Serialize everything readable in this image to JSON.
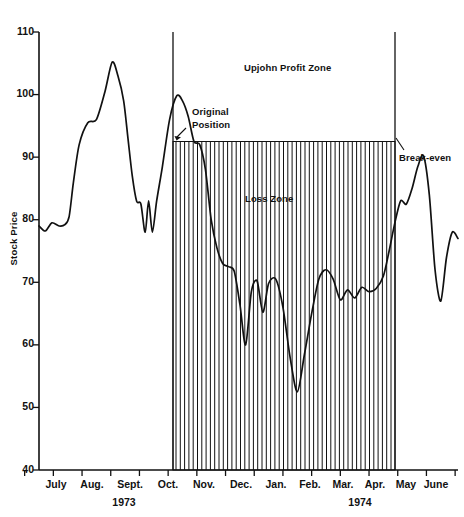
{
  "chart_data": {
    "type": "line",
    "title": "",
    "xlabel": "",
    "ylabel": "Stock Price",
    "ylim": [
      40,
      110
    ],
    "yticks": [
      40,
      50,
      60,
      70,
      80,
      90,
      100,
      110
    ],
    "ytick_labels": [
      "40",
      "50",
      "60",
      "70",
      "80",
      "90",
      "100",
      "110"
    ],
    "grid": false,
    "legend": "none",
    "xtick_labels": [
      "July",
      "Aug.",
      "Sept.",
      "Oct.",
      "Nov.",
      "Dec.",
      "Jan.",
      "Feb.",
      "Mar.",
      "Apr.",
      "May",
      "June",
      "July",
      "Aug.",
      "Sept."
    ],
    "year_labels": [
      "1973",
      "1974"
    ],
    "series": [
      {
        "name": "Upjohn stock price",
        "x": [
          0.0,
          0.22,
          0.45,
          0.7,
          0.9,
          1.05,
          1.2,
          1.4,
          1.7,
          2.0,
          2.3,
          2.55,
          2.75,
          2.95,
          3.1,
          3.25,
          3.4,
          3.55,
          3.7,
          3.82,
          3.95,
          4.1,
          4.3,
          4.55,
          4.8,
          5.0,
          5.2,
          5.4,
          5.6,
          5.8,
          6.0,
          6.2,
          6.4,
          6.6,
          6.8,
          7.0,
          7.2,
          7.4,
          7.6,
          7.8,
          8.0,
          8.25,
          8.5,
          8.75,
          9.0,
          9.25,
          9.5,
          9.75,
          10.0,
          10.25,
          10.5,
          10.75,
          11.0,
          11.25,
          11.5,
          11.75,
          12.0,
          12.2,
          12.4,
          12.6,
          12.8,
          13.0,
          13.2,
          13.4,
          13.6,
          13.8,
          14.0,
          14.2,
          14.4,
          14.6
        ],
        "values": [
          79.0,
          78.2,
          79.5,
          79.0,
          79.2,
          80.5,
          86.0,
          92.0,
          95.5,
          96.0,
          100.5,
          105.2,
          103.0,
          99.0,
          93.0,
          87.0,
          83.0,
          82.5,
          78.0,
          83.0,
          78.0,
          83.0,
          88.5,
          96.0,
          99.8,
          99.0,
          96.5,
          92.5,
          92.0,
          88.0,
          80.0,
          75.5,
          73.0,
          72.5,
          71.8,
          66.5,
          60.0,
          68.5,
          70.2,
          65.2,
          69.8,
          70.5,
          66.0,
          58.0,
          52.5,
          58.5,
          65.0,
          70.5,
          72.0,
          70.5,
          67.2,
          68.8,
          67.5,
          69.2,
          68.5,
          69.0,
          71.0,
          75.0,
          79.5,
          83.0,
          82.5,
          85.0,
          88.5,
          90.2,
          84.0,
          72.0,
          67.0,
          74.0,
          78.0,
          77.0
        ]
      }
    ],
    "annotations": [
      {
        "name": "upjohn-profit-zone",
        "text": "Upjohn Profit Zone"
      },
      {
        "name": "original-position",
        "text": "Original\nPosition"
      },
      {
        "name": "loss-zone",
        "text": "Loss Zone"
      },
      {
        "name": "break-even",
        "text": "Break-even"
      }
    ],
    "zones": {
      "loss_zone_top_value": 92.5,
      "loss_zone_start_label": "Nov.",
      "loss_zone_end_label": "Aug."
    }
  }
}
